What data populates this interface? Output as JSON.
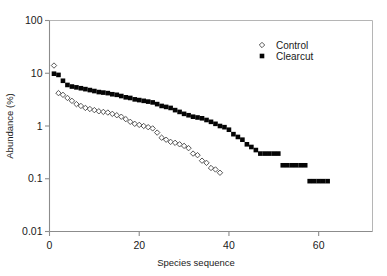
{
  "chart_data": {
    "type": "scatter",
    "title": "",
    "xlabel": "Species sequence",
    "ylabel": "Abundance (%)",
    "yscale": "log",
    "xlim": [
      0,
      72
    ],
    "ylim": [
      0.01,
      100
    ],
    "grid": false,
    "legend_position": "top-right",
    "x_ticks": [
      0,
      20,
      40,
      60
    ],
    "x_tick_labels": [
      "0",
      "20",
      "40",
      "60"
    ],
    "y_ticks": [
      0.01,
      0.1,
      1,
      10,
      100
    ],
    "y_tick_labels": [
      "0.01",
      "0.1",
      "1",
      "10",
      "100"
    ],
    "series": [
      {
        "name": "Control",
        "marker": "open-diamond",
        "color": "#ffffff",
        "edge_color": "#3a3a3a",
        "x": [
          1,
          2,
          3,
          4,
          5,
          6,
          7,
          8,
          9,
          10,
          11,
          12,
          13,
          14,
          15,
          16,
          17,
          18,
          19,
          20,
          21,
          22,
          23,
          24,
          25,
          26,
          27,
          28,
          29,
          30,
          31,
          32,
          33,
          34,
          35,
          36,
          37,
          38
        ],
        "y": [
          14.0,
          4.2,
          3.9,
          3.4,
          3.0,
          2.6,
          2.4,
          2.2,
          2.1,
          2.0,
          1.9,
          1.85,
          1.8,
          1.7,
          1.6,
          1.5,
          1.35,
          1.2,
          1.1,
          1.05,
          1.0,
          0.95,
          0.9,
          0.75,
          0.6,
          0.55,
          0.5,
          0.48,
          0.45,
          0.42,
          0.38,
          0.3,
          0.28,
          0.22,
          0.2,
          0.16,
          0.15,
          0.13
        ]
      },
      {
        "name": "Clearcut",
        "marker": "filled-square",
        "color": "#050505",
        "edge_color": "#050505",
        "x": [
          1,
          2,
          3,
          4,
          5,
          6,
          7,
          8,
          9,
          10,
          11,
          12,
          13,
          14,
          15,
          16,
          17,
          18,
          19,
          20,
          21,
          22,
          23,
          24,
          25,
          26,
          27,
          28,
          29,
          30,
          31,
          32,
          33,
          34,
          35,
          36,
          37,
          38,
          39,
          40,
          41,
          42,
          43,
          44,
          45,
          46,
          47,
          48,
          49,
          50,
          51,
          52,
          53,
          54,
          55,
          56,
          57,
          58,
          59,
          60,
          61,
          62
        ],
        "y": [
          9.8,
          9.3,
          7.2,
          6.0,
          5.6,
          5.4,
          5.2,
          5.0,
          4.8,
          4.6,
          4.4,
          4.3,
          4.2,
          4.0,
          3.9,
          3.7,
          3.5,
          3.4,
          3.2,
          3.1,
          3.0,
          2.9,
          2.8,
          2.6,
          2.4,
          2.3,
          2.2,
          2.0,
          1.85,
          1.7,
          1.6,
          1.5,
          1.45,
          1.4,
          1.3,
          1.2,
          1.1,
          1.0,
          0.95,
          0.85,
          0.7,
          0.62,
          0.55,
          0.45,
          0.4,
          0.35,
          0.3,
          0.3,
          0.3,
          0.3,
          0.3,
          0.18,
          0.18,
          0.18,
          0.18,
          0.18,
          0.18,
          0.09,
          0.09,
          0.09,
          0.09,
          0.09
        ]
      }
    ],
    "tail_runs": [
      {
        "series": "Control",
        "x_from": 32,
        "x_to": 37,
        "y": 0.09
      },
      {
        "series": "Clearcut",
        "x_from": 50,
        "x_to": 62,
        "y": 0.09
      }
    ]
  }
}
